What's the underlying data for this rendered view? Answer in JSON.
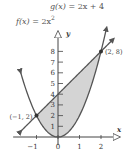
{
  "chart_data": {
    "type": "line",
    "title": "",
    "xlabel": "x",
    "ylabel": "y",
    "xlim": [
      -1.9,
      2.6
    ],
    "ylim": [
      0,
      9.2
    ],
    "x_ticks": [
      -1,
      0,
      1,
      2
    ],
    "x_tick_labels": [
      "−1",
      "0",
      "1",
      "2"
    ],
    "y_ticks": [
      1,
      2,
      3,
      4,
      5,
      6,
      7,
      8
    ],
    "y_tick_labels": [
      "1",
      "2",
      "3",
      "4",
      "5",
      "6",
      "7",
      "8"
    ],
    "grid": false,
    "series": [
      {
        "name": "f(x) = 2x²",
        "expr": "2*x^2",
        "x_range": [
          -1.75,
          2.25
        ],
        "color": "#555555"
      },
      {
        "name": "g(x) = 2x + 4",
        "expr": "2*x+4",
        "x_range": [
          -1.75,
          2.55
        ],
        "color": "#555555"
      }
    ],
    "shaded_region": {
      "between": [
        "g(x)",
        "f(x)"
      ],
      "x_range": [
        -1,
        2
      ],
      "color": "#d4d4d4"
    },
    "points": [
      {
        "x": -1,
        "y": 2,
        "label": "(−1, 2)"
      },
      {
        "x": 2,
        "y": 8,
        "label": "(2, 8)"
      }
    ],
    "annotations": {
      "g_label": {
        "fn": "g(x)",
        "eq": " = 2x + 4"
      },
      "f_label": {
        "fn": "f(x)",
        "eq": " = 2x",
        "sup": "2"
      }
    }
  }
}
